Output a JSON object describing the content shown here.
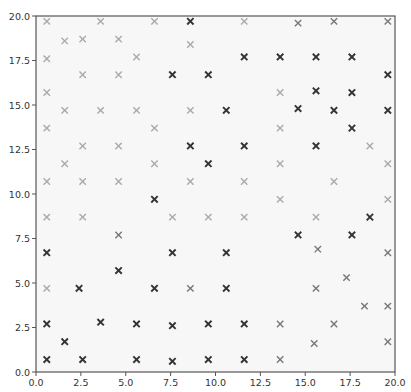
{
  "chart_data": {
    "type": "scatter",
    "title": "",
    "xlabel": "",
    "ylabel": "",
    "xlim": [
      0,
      20
    ],
    "ylim": [
      0,
      20
    ],
    "grid": false,
    "legend": null,
    "marker": "x",
    "xticks": [
      "0.0",
      "2.5",
      "5.0",
      "7.5",
      "10.0",
      "12.5",
      "15.0",
      "17.5",
      "20.0"
    ],
    "yticks": [
      "0.0",
      "2.5",
      "5.0",
      "7.5",
      "10.0",
      "12.5",
      "15.0",
      "17.5",
      "20.0"
    ],
    "shade_levels": {
      "dark": "#333333",
      "medium": "#777777",
      "light": "#aaaaaa"
    },
    "points": [
      {
        "x": 0.6,
        "y": 19.7,
        "shade": "light"
      },
      {
        "x": 3.6,
        "y": 19.7,
        "shade": "light"
      },
      {
        "x": 6.6,
        "y": 19.7,
        "shade": "light"
      },
      {
        "x": 8.6,
        "y": 19.7,
        "shade": "dark"
      },
      {
        "x": 11.6,
        "y": 19.7,
        "shade": "light"
      },
      {
        "x": 14.6,
        "y": 19.6,
        "shade": "medium"
      },
      {
        "x": 16.6,
        "y": 19.7,
        "shade": "medium"
      },
      {
        "x": 19.6,
        "y": 19.7,
        "shade": "medium"
      },
      {
        "x": 1.6,
        "y": 18.6,
        "shade": "light"
      },
      {
        "x": 2.6,
        "y": 18.7,
        "shade": "light"
      },
      {
        "x": 4.6,
        "y": 18.7,
        "shade": "light"
      },
      {
        "x": 8.6,
        "y": 18.4,
        "shade": "light"
      },
      {
        "x": 0.6,
        "y": 17.6,
        "shade": "light"
      },
      {
        "x": 5.6,
        "y": 17.7,
        "shade": "light"
      },
      {
        "x": 11.6,
        "y": 17.7,
        "shade": "dark"
      },
      {
        "x": 13.6,
        "y": 17.7,
        "shade": "dark"
      },
      {
        "x": 15.6,
        "y": 17.7,
        "shade": "dark"
      },
      {
        "x": 17.6,
        "y": 17.7,
        "shade": "dark"
      },
      {
        "x": 2.6,
        "y": 16.7,
        "shade": "light"
      },
      {
        "x": 4.6,
        "y": 16.7,
        "shade": "light"
      },
      {
        "x": 7.6,
        "y": 16.7,
        "shade": "dark"
      },
      {
        "x": 9.6,
        "y": 16.7,
        "shade": "dark"
      },
      {
        "x": 19.6,
        "y": 16.7,
        "shade": "dark"
      },
      {
        "x": 0.6,
        "y": 15.7,
        "shade": "light"
      },
      {
        "x": 13.6,
        "y": 15.7,
        "shade": "light"
      },
      {
        "x": 15.6,
        "y": 15.8,
        "shade": "dark"
      },
      {
        "x": 17.6,
        "y": 15.7,
        "shade": "dark"
      },
      {
        "x": 1.6,
        "y": 14.7,
        "shade": "light"
      },
      {
        "x": 3.6,
        "y": 14.7,
        "shade": "light"
      },
      {
        "x": 5.6,
        "y": 14.7,
        "shade": "light"
      },
      {
        "x": 8.6,
        "y": 14.7,
        "shade": "light"
      },
      {
        "x": 10.6,
        "y": 14.7,
        "shade": "dark"
      },
      {
        "x": 14.6,
        "y": 14.8,
        "shade": "dark"
      },
      {
        "x": 16.6,
        "y": 14.7,
        "shade": "dark"
      },
      {
        "x": 19.6,
        "y": 14.7,
        "shade": "dark"
      },
      {
        "x": 0.6,
        "y": 13.7,
        "shade": "light"
      },
      {
        "x": 6.6,
        "y": 13.7,
        "shade": "light"
      },
      {
        "x": 13.6,
        "y": 13.7,
        "shade": "light"
      },
      {
        "x": 17.6,
        "y": 13.7,
        "shade": "dark"
      },
      {
        "x": 2.6,
        "y": 12.7,
        "shade": "light"
      },
      {
        "x": 4.6,
        "y": 12.7,
        "shade": "light"
      },
      {
        "x": 8.6,
        "y": 12.7,
        "shade": "dark"
      },
      {
        "x": 11.6,
        "y": 12.7,
        "shade": "dark"
      },
      {
        "x": 15.6,
        "y": 12.7,
        "shade": "dark"
      },
      {
        "x": 18.6,
        "y": 12.7,
        "shade": "light"
      },
      {
        "x": 1.6,
        "y": 11.7,
        "shade": "light"
      },
      {
        "x": 6.6,
        "y": 11.7,
        "shade": "light"
      },
      {
        "x": 9.6,
        "y": 11.7,
        "shade": "dark"
      },
      {
        "x": 13.6,
        "y": 11.7,
        "shade": "light"
      },
      {
        "x": 19.6,
        "y": 11.7,
        "shade": "light"
      },
      {
        "x": 0.6,
        "y": 10.7,
        "shade": "light"
      },
      {
        "x": 2.6,
        "y": 10.7,
        "shade": "light"
      },
      {
        "x": 4.6,
        "y": 10.7,
        "shade": "light"
      },
      {
        "x": 8.6,
        "y": 10.7,
        "shade": "light"
      },
      {
        "x": 11.6,
        "y": 10.7,
        "shade": "light"
      },
      {
        "x": 16.6,
        "y": 10.7,
        "shade": "light"
      },
      {
        "x": 6.6,
        "y": 9.7,
        "shade": "dark"
      },
      {
        "x": 13.6,
        "y": 9.7,
        "shade": "light"
      },
      {
        "x": 19.6,
        "y": 9.7,
        "shade": "light"
      },
      {
        "x": 0.6,
        "y": 8.7,
        "shade": "light"
      },
      {
        "x": 2.6,
        "y": 8.7,
        "shade": "light"
      },
      {
        "x": 7.6,
        "y": 8.7,
        "shade": "light"
      },
      {
        "x": 9.6,
        "y": 8.7,
        "shade": "light"
      },
      {
        "x": 11.6,
        "y": 8.7,
        "shade": "light"
      },
      {
        "x": 15.6,
        "y": 8.7,
        "shade": "light"
      },
      {
        "x": 18.6,
        "y": 8.7,
        "shade": "dark"
      },
      {
        "x": 4.6,
        "y": 7.7,
        "shade": "medium"
      },
      {
        "x": 14.6,
        "y": 7.7,
        "shade": "dark"
      },
      {
        "x": 17.6,
        "y": 7.7,
        "shade": "dark"
      },
      {
        "x": 0.6,
        "y": 6.7,
        "shade": "dark"
      },
      {
        "x": 7.6,
        "y": 6.7,
        "shade": "dark"
      },
      {
        "x": 10.6,
        "y": 6.7,
        "shade": "dark"
      },
      {
        "x": 15.7,
        "y": 6.9,
        "shade": "medium"
      },
      {
        "x": 19.6,
        "y": 6.7,
        "shade": "medium"
      },
      {
        "x": 4.6,
        "y": 5.7,
        "shade": "dark"
      },
      {
        "x": 17.3,
        "y": 5.3,
        "shade": "medium"
      },
      {
        "x": 0.6,
        "y": 4.7,
        "shade": "light"
      },
      {
        "x": 2.4,
        "y": 4.7,
        "shade": "dark"
      },
      {
        "x": 6.6,
        "y": 4.7,
        "shade": "dark"
      },
      {
        "x": 8.6,
        "y": 4.7,
        "shade": "medium"
      },
      {
        "x": 10.6,
        "y": 4.7,
        "shade": "dark"
      },
      {
        "x": 15.6,
        "y": 4.7,
        "shade": "medium"
      },
      {
        "x": 18.3,
        "y": 3.7,
        "shade": "medium"
      },
      {
        "x": 19.6,
        "y": 3.7,
        "shade": "medium"
      },
      {
        "x": 0.6,
        "y": 2.7,
        "shade": "dark"
      },
      {
        "x": 3.6,
        "y": 2.8,
        "shade": "dark"
      },
      {
        "x": 5.6,
        "y": 2.7,
        "shade": "dark"
      },
      {
        "x": 7.6,
        "y": 2.6,
        "shade": "dark"
      },
      {
        "x": 9.6,
        "y": 2.7,
        "shade": "dark"
      },
      {
        "x": 11.6,
        "y": 2.7,
        "shade": "dark"
      },
      {
        "x": 13.6,
        "y": 2.7,
        "shade": "medium"
      },
      {
        "x": 16.6,
        "y": 2.7,
        "shade": "medium"
      },
      {
        "x": 1.6,
        "y": 1.7,
        "shade": "dark"
      },
      {
        "x": 15.5,
        "y": 1.6,
        "shade": "medium"
      },
      {
        "x": 19.6,
        "y": 1.7,
        "shade": "medium"
      },
      {
        "x": 0.6,
        "y": 0.7,
        "shade": "dark"
      },
      {
        "x": 2.6,
        "y": 0.7,
        "shade": "dark"
      },
      {
        "x": 5.6,
        "y": 0.7,
        "shade": "dark"
      },
      {
        "x": 7.6,
        "y": 0.6,
        "shade": "dark"
      },
      {
        "x": 9.6,
        "y": 0.7,
        "shade": "dark"
      },
      {
        "x": 11.6,
        "y": 0.7,
        "shade": "dark"
      },
      {
        "x": 13.6,
        "y": 0.7,
        "shade": "medium"
      }
    ]
  }
}
